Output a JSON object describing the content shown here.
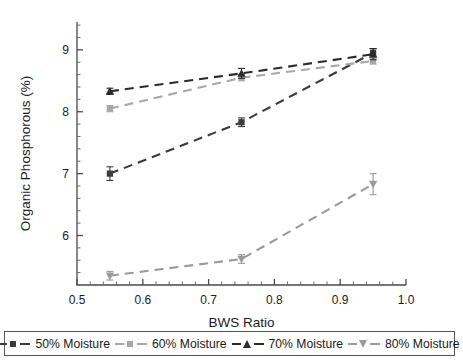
{
  "chart_data": {
    "type": "line",
    "title": "",
    "xlabel": "BWS Ratio",
    "ylabel": "Organic Phosphorous (%)",
    "x": [
      0.55,
      0.75,
      0.95
    ],
    "xlim": [
      0.5,
      1.0
    ],
    "ylim": [
      5.2,
      9.45
    ],
    "xticks": [
      "0.5",
      "0.6",
      "0.7",
      "0.8",
      "0.9",
      "1.0"
    ],
    "xtick_values": [
      0.5,
      0.6,
      0.7,
      0.8,
      0.9,
      1.0
    ],
    "yticks": [
      "6",
      "7",
      "8",
      "9"
    ],
    "ytick_values": [
      6,
      7,
      8,
      9
    ],
    "grid": false,
    "legend_position": "bottom",
    "linestyle": "dashed",
    "series": [
      {
        "name": "50% Moisture",
        "marker": "square",
        "color": "#3b3b3b",
        "values": [
          7.0,
          7.83,
          8.95
        ],
        "errors": [
          0.11,
          0.07,
          0.07
        ]
      },
      {
        "name": "60% Moisture",
        "marker": "square",
        "color": "#a8a8a8",
        "values": [
          8.05,
          8.55,
          8.82
        ],
        "errors": [
          0.05,
          0.05,
          0.05
        ]
      },
      {
        "name": "70% Moisture",
        "marker": "triangle-up",
        "color": "#2b2b2b",
        "values": [
          8.33,
          8.62,
          8.93
        ],
        "errors": [
          0.05,
          0.08,
          0.09
        ]
      },
      {
        "name": "80% Moisture",
        "marker": "triangle-down",
        "color": "#9a9a9a",
        "values": [
          5.35,
          5.62,
          6.83
        ],
        "errors": [
          0.07,
          0.07,
          0.17
        ]
      }
    ]
  },
  "legend": {
    "items": [
      {
        "label": "50% Moisture",
        "color": "#3b3b3b",
        "marker": "square"
      },
      {
        "label": "60% Moisture",
        "color": "#a8a8a8",
        "marker": "square"
      },
      {
        "label": "70% Moisture",
        "color": "#2b2b2b",
        "marker": "triangle-up"
      },
      {
        "label": "80% Moisture",
        "color": "#9a9a9a",
        "marker": "triangle-down"
      }
    ]
  }
}
